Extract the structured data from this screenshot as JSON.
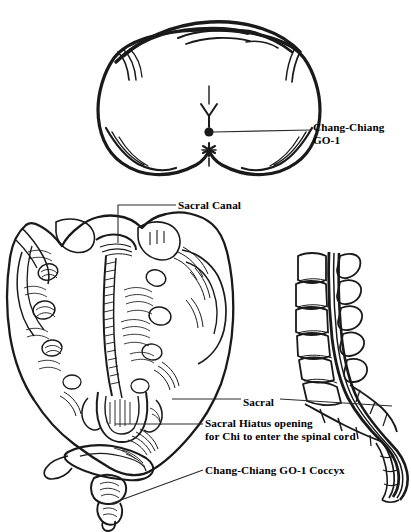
{
  "figure": {
    "title_semantic": "Chang-Chiang GO-1 acupuncture point and sacral anatomy",
    "background_color": "#ffffff",
    "ink_color": "#1a1a1a",
    "width_px": 411,
    "height_px": 532
  },
  "labels": {
    "chang_chiang_go1_line1": "Chang-Chiang",
    "chang_chiang_go1_line2": "GO-1",
    "sacral_canal": "Sacral Canal",
    "sacral": "Sacral",
    "sacral_hiatus_line1": "Sacral Hiatus opening",
    "sacral_hiatus_line2": "for Chi to enter the spinal cord",
    "coccyx": "Chang-Chiang GO-1 Coccyx"
  },
  "panels": {
    "buttocks": {
      "name": "posterior-buttocks-view",
      "caption": "",
      "acupoint_marker": "solid-dot",
      "anus_marker": "asterisk",
      "coccyx_marker": "y-shape"
    },
    "sacrum": {
      "name": "posterior-sacrum-view",
      "caption": ""
    },
    "lateral_spine": {
      "name": "lateral-lumbosacral-spine-view",
      "caption": ""
    }
  }
}
